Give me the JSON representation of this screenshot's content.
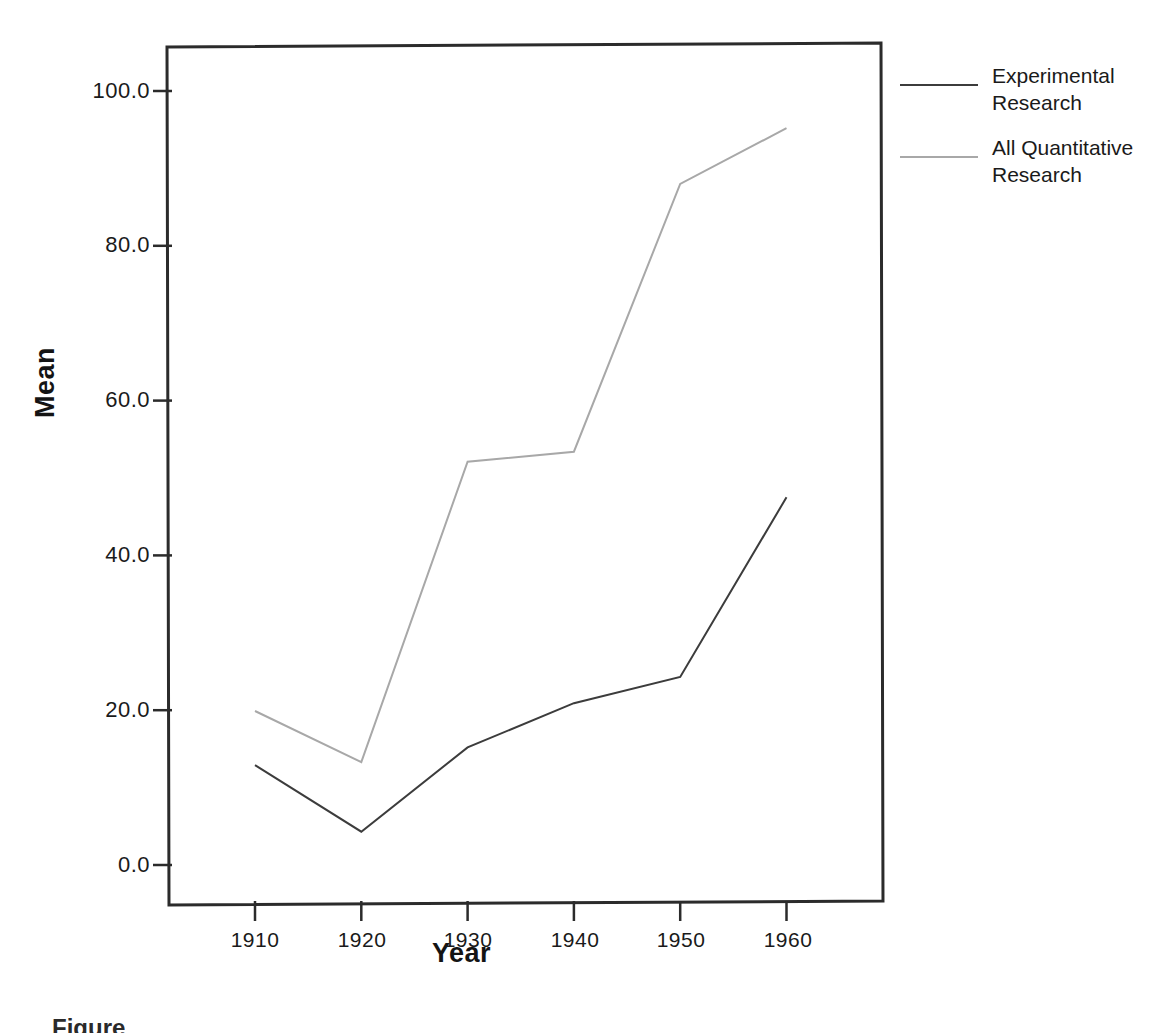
{
  "chart_data": {
    "type": "line",
    "title": "",
    "xlabel": "Year",
    "ylabel": "Mean",
    "x": [
      1910,
      1920,
      1930,
      1940,
      1950,
      1960
    ],
    "xtick_labels": [
      "1910",
      "1920",
      "1930",
      "1940",
      "1950",
      "1960"
    ],
    "ytick_labels": [
      "0.0",
      "20.0",
      "40.0",
      "60.0",
      "80.0",
      "100.0"
    ],
    "ytick_values": [
      0,
      20,
      40,
      60,
      80,
      100
    ],
    "ylim": [
      -5,
      105
    ],
    "xlim": [
      1903,
      1972
    ],
    "grid": false,
    "legend_position": "right",
    "series": [
      {
        "name": "Experimental Research",
        "color": "#3c3c3c",
        "values": [
          12.9,
          4.3,
          15.2,
          20.9,
          24.3,
          47.5
        ]
      },
      {
        "name": "All Quantitative Research",
        "color": "#a8a8a8",
        "values": [
          19.9,
          13.3,
          52.1,
          53.4,
          88.0,
          95.2
        ]
      }
    ]
  },
  "legend": {
    "entries": [
      {
        "label": "Experimental Research"
      },
      {
        "label": "All Quantitative Research"
      }
    ]
  },
  "axes": {
    "y_title": "Mean",
    "x_title": "Year"
  },
  "caption": {
    "text": "Figure"
  }
}
